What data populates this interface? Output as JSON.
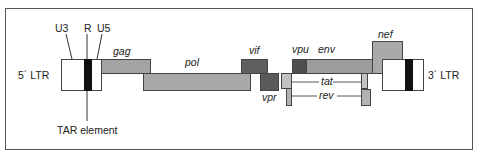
{
  "diagram": {
    "ltr5": {
      "label": "5´ LTR"
    },
    "ltr3": {
      "label": "3´ LTR"
    },
    "ltr_regions": {
      "u3": "U3",
      "r": "R",
      "u5": "U5"
    },
    "tar": {
      "label": "TAR element"
    },
    "genes": {
      "gag": {
        "label": "gag",
        "color": "#a3a3a3"
      },
      "pol": {
        "label": "pol",
        "color": "#a8a8a8"
      },
      "vif": {
        "label": "vif",
        "color": "#5e5e5e"
      },
      "vpr": {
        "label": "vpr",
        "color": "#5a5a5a"
      },
      "vpu": {
        "label": "vpu",
        "color": "#4f4f4f"
      },
      "env": {
        "label": "env",
        "color": "#9c9c9c"
      },
      "nef": {
        "label": "nef",
        "color": "#a9a9a9"
      },
      "tat": {
        "label": "tat",
        "color": "#c2c2c2"
      },
      "rev": {
        "label": "rev",
        "color": "#b2b2b2"
      }
    },
    "colors": {
      "ltr_fill": "#ffffff",
      "r_region": "#111111",
      "outline": "#444444"
    }
  }
}
